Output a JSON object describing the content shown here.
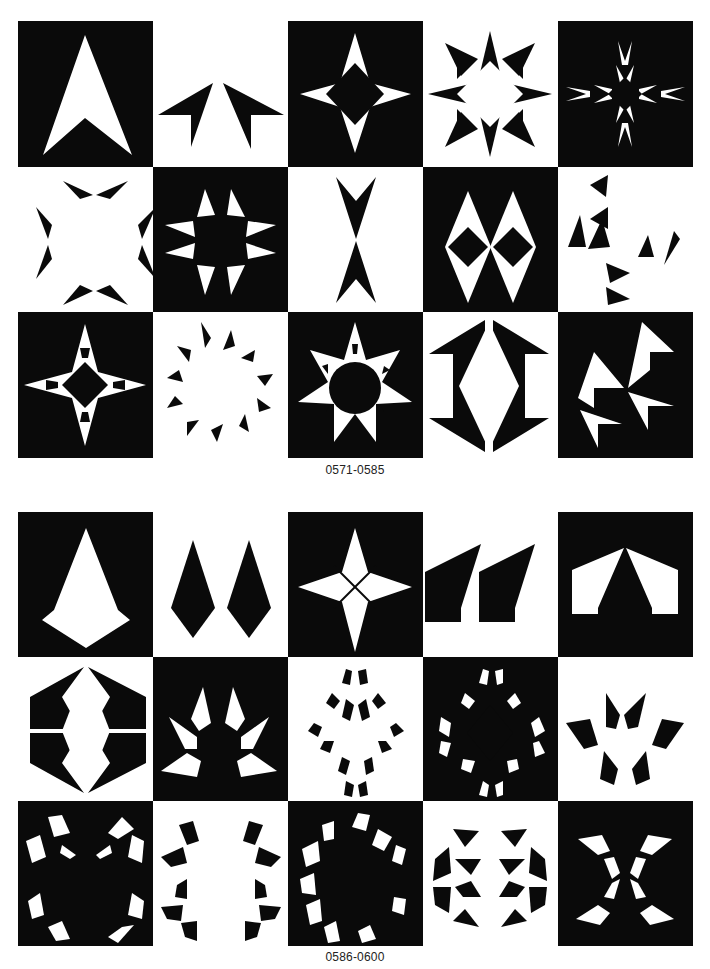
{
  "page": {
    "sections": [
      {
        "caption": "0571-0585",
        "tiles": [
          {
            "id": "0571",
            "bg": "black",
            "fg": "#ffffff",
            "motif": "single-arrowhead"
          },
          {
            "id": "0572",
            "bg": "white",
            "fg": "#0a0a0a",
            "motif": "twin-barbed-wings"
          },
          {
            "id": "0573",
            "bg": "black",
            "fg": "#ffffff",
            "motif": "four-point-star-diamond-center"
          },
          {
            "id": "0574",
            "bg": "white",
            "fg": "#0a0a0a",
            "motif": "eight-point-star-square-frame"
          },
          {
            "id": "0575",
            "bg": "black",
            "fg": "#ffffff",
            "motif": "cross-of-barbs"
          },
          {
            "id": "0576",
            "bg": "white",
            "fg": "#0a0a0a",
            "motif": "ring-of-eight-barbs"
          },
          {
            "id": "0577",
            "bg": "black",
            "fg": "#ffffff",
            "motif": "barbed-quatrefoil"
          },
          {
            "id": "0578",
            "bg": "white",
            "fg": "#0a0a0a",
            "motif": "opposed-arrowheads-vertical"
          },
          {
            "id": "0579",
            "bg": "black",
            "fg": "#ffffff",
            "motif": "twin-diamond-lozenges"
          },
          {
            "id": "0580",
            "bg": "white",
            "fg": "#0a0a0a",
            "motif": "triskelion-of-barbs"
          },
          {
            "id": "0581",
            "bg": "black",
            "fg": "#ffffff",
            "motif": "four-point-star-notched"
          },
          {
            "id": "0582",
            "bg": "white",
            "fg": "#0a0a0a",
            "motif": "sunburst-ring-of-barbs"
          },
          {
            "id": "0583",
            "bg": "black",
            "fg": "#ffffff",
            "motif": "seven-point-star-notched"
          },
          {
            "id": "0584",
            "bg": "white",
            "fg": "#0a0a0a",
            "motif": "bracket-diamond"
          },
          {
            "id": "0585",
            "bg": "black",
            "fg": "#ffffff",
            "motif": "triple-barbed-arrows"
          }
        ]
      },
      {
        "caption": "0586-0600",
        "tiles": [
          {
            "id": "0586",
            "bg": "black",
            "fg": "#ffffff",
            "motif": "kite-pendant"
          },
          {
            "id": "0587",
            "bg": "white",
            "fg": "#0a0a0a",
            "motif": "twin-kite-pendants"
          },
          {
            "id": "0588",
            "bg": "black",
            "fg": "#ffffff",
            "motif": "four-point-star-crossed"
          },
          {
            "id": "0589",
            "bg": "white",
            "fg": "#0a0a0a",
            "motif": "twin-slanted-blocks"
          },
          {
            "id": "0590",
            "bg": "black",
            "fg": "#ffffff",
            "motif": "tent-arch"
          },
          {
            "id": "0591",
            "bg": "white",
            "fg": "#0a0a0a",
            "motif": "split-hexagon-lens"
          },
          {
            "id": "0592",
            "bg": "black",
            "fg": "#ffffff",
            "motif": "crown-of-shards"
          },
          {
            "id": "0593",
            "bg": "white",
            "fg": "#0a0a0a",
            "motif": "diamond-lattice-of-shards"
          },
          {
            "id": "0594",
            "bg": "black",
            "fg": "#ffffff",
            "motif": "diamond-lattice-of-shards-inverse"
          },
          {
            "id": "0595",
            "bg": "white",
            "fg": "#0a0a0a",
            "motif": "six-shard-cluster"
          },
          {
            "id": "0596",
            "bg": "black",
            "fg": "#ffffff",
            "motif": "x-of-shards-square-center"
          },
          {
            "id": "0597",
            "bg": "white",
            "fg": "#0a0a0a",
            "motif": "ring-of-shards"
          },
          {
            "id": "0598",
            "bg": "black",
            "fg": "#ffffff",
            "motif": "c-ring-of-shards"
          },
          {
            "id": "0599",
            "bg": "white",
            "fg": "#0a0a0a",
            "motif": "hexagonal-shard-web"
          },
          {
            "id": "0600",
            "bg": "black",
            "fg": "#ffffff",
            "motif": "hourglass-x-of-shards"
          }
        ]
      }
    ]
  }
}
